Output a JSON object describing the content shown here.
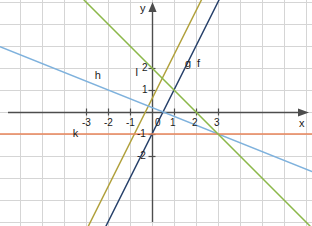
{
  "chart_data": {
    "type": "line",
    "title": "",
    "xlabel": "x",
    "ylabel": "y",
    "grid": true,
    "xlim": [
      -3.85,
      3.95
    ],
    "ylim": [
      -2.75,
      2.55
    ],
    "axis_origin_px": [
      152,
      112
    ],
    "unit_px": 22,
    "xticks": [
      -3,
      -2,
      -1,
      0,
      1,
      2,
      3
    ],
    "xtick_labels": [
      "-3",
      "-2",
      "-1",
      "0",
      "1",
      "2",
      "3"
    ],
    "yticks": [
      -2,
      -1,
      1,
      2
    ],
    "ytick_labels": [
      "-2",
      "-1",
      "1",
      "2"
    ],
    "series": [
      {
        "name": "f",
        "label": "f",
        "color": "#27416b",
        "slope": 2.0,
        "intercept": -1.0,
        "equation": "y = 2x - 1",
        "x_intercept": 0.5,
        "label_pos": [
          2.05,
          2.45
        ]
      },
      {
        "name": "g",
        "label": "g",
        "color": "#b1a13c",
        "slope": 2.0,
        "intercept": 0.6,
        "equation": "y = 2x + 0.6",
        "x_intercept": -0.3,
        "label_pos": [
          1.5,
          2.45
        ]
      },
      {
        "name": "h",
        "label": "h",
        "color": "#7fb2dd",
        "slope": -0.4,
        "intercept": 0.2,
        "equation": "y = -0.4x + 0.2",
        "x_intercept": 0.5,
        "label_pos": [
          -2.6,
          1.9
        ]
      },
      {
        "name": "k",
        "label": "k",
        "color": "#e8855a",
        "slope": 0.0,
        "intercept": -1.0,
        "equation": "y = -1",
        "label_pos": [
          -3.6,
          -0.72
        ]
      },
      {
        "name": "l",
        "label": "l",
        "color": "#8cb84a",
        "slope": -1.0,
        "intercept": 2.0,
        "equation": "y = -x + 2",
        "x_intercept": 2.0,
        "label_pos": [
          -0.75,
          2.05
        ]
      }
    ],
    "legend_position": "inline-labels",
    "axis_color": "#4d4d4d",
    "grid_color": "#d5d5d5",
    "background": "#ffffff"
  },
  "axes": {
    "x_axis_label": "x",
    "y_axis_label": "y"
  }
}
